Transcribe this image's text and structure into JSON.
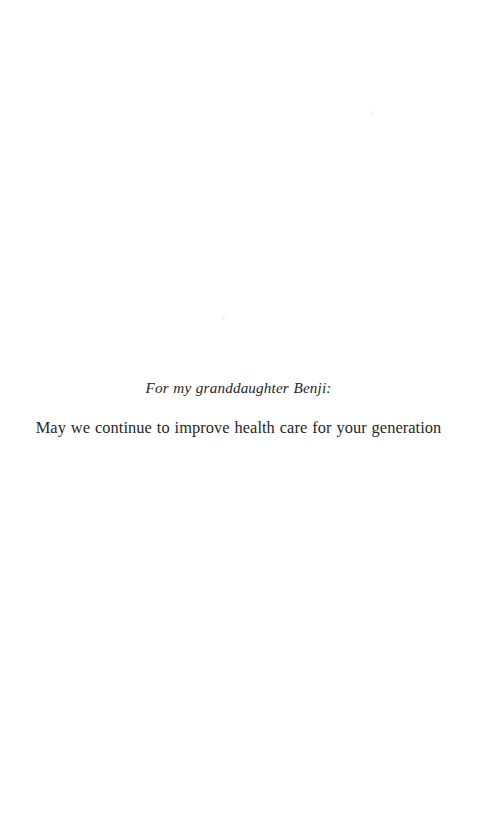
{
  "page": {
    "kind": "book-dedication-page",
    "background_color": "#ffffff",
    "ink_color": "#28262b",
    "width": 477,
    "height": 819
  },
  "dedication": {
    "salutation": "For my granddaughter Benji:",
    "message": "May we continue to improve health care for your generation"
  }
}
